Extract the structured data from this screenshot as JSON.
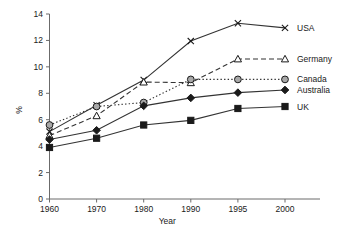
{
  "chart_data": {
    "type": "line",
    "title": "",
    "xlabel": "Year",
    "ylabel": "%",
    "categories": [
      "1960",
      "1970",
      "1980",
      "1990",
      "1995",
      "2000"
    ],
    "ylim": [
      0,
      14
    ],
    "ytick_step": 2,
    "yticks": [
      "0",
      "2",
      "4",
      "6",
      "8",
      "10",
      "12",
      "14"
    ],
    "grid": false,
    "legend_position": "right",
    "series": [
      {
        "name": "USA",
        "marker": "cross",
        "linestyle": "solid",
        "color": "#333333",
        "values": [
          5.1,
          7.1,
          9.0,
          11.95,
          13.3,
          12.95
        ]
      },
      {
        "name": "Germany",
        "marker": "triangle-open",
        "linestyle": "dashed",
        "color": "#333333",
        "values": [
          4.8,
          6.3,
          8.85,
          8.8,
          10.6,
          10.6
        ]
      },
      {
        "name": "Canada",
        "marker": "circle-grey",
        "linestyle": "dotted",
        "color": "#333333",
        "values": [
          5.6,
          7.0,
          7.3,
          9.05,
          9.05,
          9.05
        ]
      },
      {
        "name": "Australia",
        "marker": "diamond-filled",
        "linestyle": "solid",
        "color": "#333333",
        "values": [
          4.5,
          5.2,
          7.05,
          7.65,
          8.05,
          8.25
        ]
      },
      {
        "name": "UK",
        "marker": "square-filled",
        "linestyle": "solid",
        "color": "#333333",
        "values": [
          3.9,
          4.6,
          5.6,
          5.95,
          6.85,
          7.0
        ]
      }
    ]
  },
  "legend": {
    "entries": [
      {
        "label": "USA"
      },
      {
        "label": "Germany"
      },
      {
        "label": "Canada"
      },
      {
        "label": "Australia"
      },
      {
        "label": "UK"
      }
    ]
  },
  "axes": {
    "x_title": "Year",
    "y_title": "%"
  }
}
